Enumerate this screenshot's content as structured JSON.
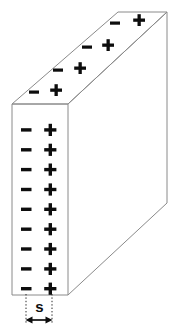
{
  "figure": {
    "dimension_label": "s",
    "minus_symbol": "−",
    "plus_symbol": "+",
    "colors": {
      "edge_stroke": "#8a8a8a",
      "face_fill": "#ffffff",
      "glyph": "#0d0d0d",
      "guide": "#2b2b2b",
      "background": "#ffffff"
    },
    "geometry": {
      "front_face": {
        "left": 12,
        "right": 68,
        "top": 104,
        "bottom": 295
      },
      "top_face": [
        [
          12,
          104
        ],
        [
          68,
          104
        ],
        [
          167,
          12
        ],
        [
          118,
          12
        ]
      ],
      "right_face": [
        [
          68,
          104
        ],
        [
          167,
          12
        ],
        [
          167,
          203
        ],
        [
          68,
          295
        ]
      ],
      "depth_offset": {
        "dx": 99,
        "dy": -92
      }
    },
    "front_face_charges": {
      "minus_x": 26,
      "plus_x": 50,
      "rows_y": [
        130,
        150,
        170,
        189,
        209,
        229,
        249,
        268,
        288
      ],
      "count": 9
    },
    "top_face_charges": [
      {
        "minus": [
          34,
          92
        ],
        "plus": [
          56,
          90
        ]
      },
      {
        "minus": [
          58,
          70
        ],
        "plus": [
          80,
          68
        ]
      },
      {
        "minus": [
          87,
          47
        ],
        "plus": [
          108,
          45
        ]
      },
      {
        "minus": [
          115,
          23
        ],
        "plus": [
          139,
          20
        ]
      }
    ],
    "dimension": {
      "label": "s",
      "label_x": 40,
      "label_y": 308,
      "guide_left_x": 26,
      "guide_right_x": 52,
      "guide_top_y": 294,
      "guide_bottom_y": 324,
      "arrow_y": 320,
      "arrow_left_x": 26,
      "arrow_right_x": 52
    }
  }
}
